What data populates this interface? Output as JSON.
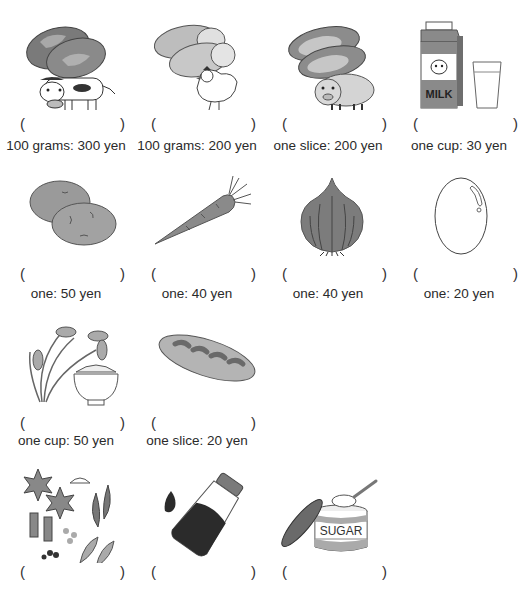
{
  "worksheet": {
    "items": [
      {
        "name": "beef",
        "image": "beef-and-cow-icon",
        "answer": "",
        "label": "100 grams: 300 yen"
      },
      {
        "name": "chicken",
        "image": "chicken-meat-and-hen-icon",
        "answer": "",
        "label": "100 grams: 200 yen"
      },
      {
        "name": "pork",
        "image": "pork-and-pig-icon",
        "answer": "",
        "label": "one slice: 200 yen"
      },
      {
        "name": "milk",
        "image": "milk-carton-and-glass-icon",
        "answer": "",
        "label": "one cup: 30 yen"
      },
      {
        "name": "potato",
        "image": "potatoes-icon",
        "answer": "",
        "label": "one: 50 yen"
      },
      {
        "name": "carrot",
        "image": "carrot-icon",
        "answer": "",
        "label": "one: 40 yen"
      },
      {
        "name": "onion",
        "image": "onion-icon",
        "answer": "",
        "label": "one: 40 yen"
      },
      {
        "name": "egg",
        "image": "egg-icon",
        "answer": "",
        "label": "one: 20 yen"
      },
      {
        "name": "rice",
        "image": "rice-plant-and-bowl-icon",
        "answer": "",
        "label": "one cup: 50 yen"
      },
      {
        "name": "bread",
        "image": "bread-loaf-icon",
        "answer": "",
        "label": "one slice: 20 yen"
      },
      {
        "name": "spices",
        "image": "spices-icon",
        "answer": "",
        "label": ""
      },
      {
        "name": "soy-sauce",
        "image": "soy-sauce-bottle-icon",
        "answer": "",
        "label": ""
      },
      {
        "name": "sugar",
        "image": "sugar-tin-icon",
        "answer": "",
        "label": ""
      }
    ],
    "paren_open": "(",
    "paren_close": ")",
    "milk_carton_text": "MILK",
    "sugar_tin_text": "SUGAR",
    "colors": {
      "ink": "#2a2a2a",
      "fill_dark": "#6f6f6f",
      "fill_mid": "#9a9a9a",
      "fill_light": "#c4c4c4"
    }
  }
}
